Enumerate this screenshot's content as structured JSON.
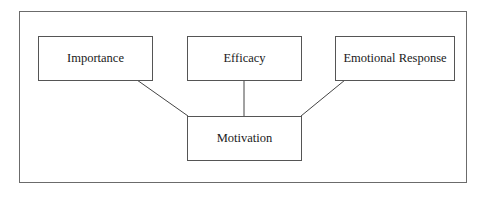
{
  "diagram": {
    "type": "concept-map",
    "nodes": [
      {
        "id": "importance",
        "label": "Importance"
      },
      {
        "id": "efficacy",
        "label": "Efficacy"
      },
      {
        "id": "emotional_response",
        "label": "Emotional Response"
      },
      {
        "id": "motivation",
        "label": "Motivation"
      }
    ],
    "edges": [
      {
        "from": "importance",
        "to": "motivation"
      },
      {
        "from": "efficacy",
        "to": "motivation"
      },
      {
        "from": "emotional_response",
        "to": "motivation"
      }
    ],
    "colors": {
      "background": "#ffffff",
      "border": "#555555",
      "text": "#1a1a1a"
    }
  }
}
